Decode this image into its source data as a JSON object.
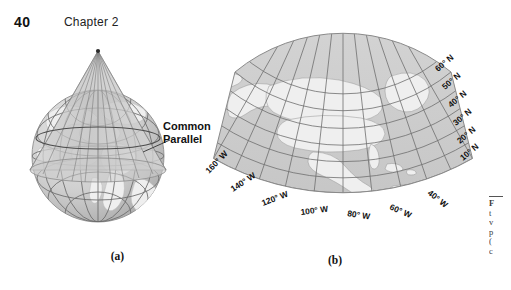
{
  "header": {
    "page_number": "40",
    "chapter": "Chapter 2"
  },
  "figure": {
    "panel_a": {
      "label": "(a)",
      "name": "globe-with-tangent-cone",
      "callout": "Common\nParallel"
    },
    "panel_b": {
      "label": "(b)",
      "name": "conic-projection-map-north-america",
      "latitude_labels": [
        "60° N",
        "50° N",
        "40° N",
        "30° N",
        "20° N",
        "10° N"
      ],
      "longitude_labels": [
        "160° W",
        "140° W",
        "120° W",
        "100° W",
        "80° W",
        "60° W",
        "40° W"
      ]
    },
    "caption_fragment": {
      "line1": "F",
      "line2": "t",
      "line3": "v",
      "line4": "p",
      "line5": "(",
      "line6": "c"
    }
  },
  "colors": {
    "page_background": "#ffffff",
    "ocean": "#c9c9c9",
    "land": "#ededed",
    "graticule": "#6e6e6e",
    "cone": "#b4b4b4",
    "globe_shade": "#a8a8a8",
    "text": "#111111"
  }
}
